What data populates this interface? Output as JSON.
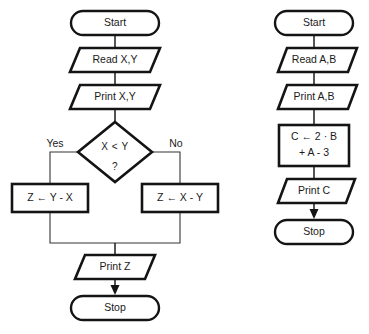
{
  "diagram": {
    "background_color": "#ffffff",
    "line_color": "#141414",
    "text_color": "#1a1a1a"
  },
  "left_flowchart": {
    "name": "Absolute difference of X and Y",
    "nodes": {
      "start": "Start",
      "read": "Read X,Y",
      "print_inputs": "Print X,Y",
      "decision_line1": "X < Y",
      "decision_line2": "?",
      "branch_yes": "Yes",
      "branch_no": "No",
      "assign_yes": "Z ← Y - X",
      "assign_no": "Z ← X - Y",
      "print_result": "Print Z",
      "stop": "Stop"
    }
  },
  "right_flowchart": {
    "name": "Compute C from A and B",
    "nodes": {
      "start": "Start",
      "read": "Read A,B",
      "print_inputs": "Print A,B",
      "assign_line1": "C ← 2 · B",
      "assign_line2": "+ A - 3",
      "print_result": "Print C",
      "stop": "Stop"
    }
  }
}
